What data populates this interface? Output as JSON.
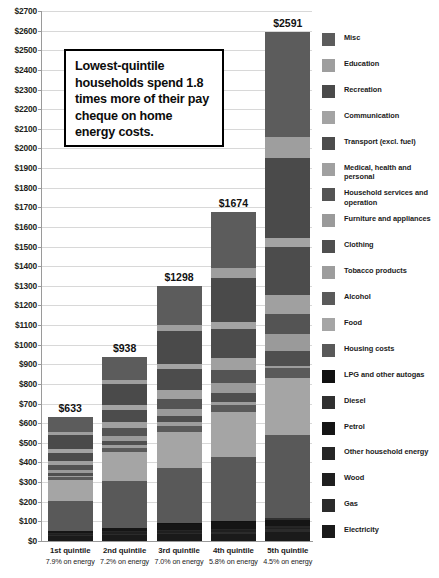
{
  "chart_data": {
    "type": "bar",
    "subtype": "stacked-bar",
    "title": "",
    "xlabel": "",
    "ylabel": "",
    "ylim": [
      0,
      2700
    ],
    "ytick_step": 100,
    "grid": true,
    "legend_position": "right",
    "currency_prefix": "$",
    "categories": [
      "1st quintile",
      "2nd quintile",
      "3rd quintile",
      "4th quintile",
      "5th quintile"
    ],
    "category_sublabels": [
      "7.9% on energy",
      "7.2% on energy",
      "7.0% on energy",
      "5.8% on energy",
      "4.5% on energy"
    ],
    "totals": [
      633,
      938,
      1298,
      1674,
      2591
    ],
    "total_labels": [
      "$633",
      "$938",
      "$1298",
      "$1674",
      "$2591"
    ],
    "ytick_labels": [
      "$2700",
      "$2600",
      "$2500",
      "$2400",
      "$2300",
      "$2200",
      "$2100",
      "$2000",
      "$1900",
      "$1800",
      "$1700",
      "$1600",
      "$1500",
      "$1400",
      "$1300",
      "$1200",
      "$1100",
      "$1000",
      "$900",
      "$800",
      "$700",
      "$600",
      "$500",
      "$400",
      "$300",
      "$200",
      "$100",
      "$0"
    ],
    "series": [
      {
        "name": "Electricity",
        "color": "#1a1a1a",
        "values": [
          26,
          30,
          33,
          37,
          45
        ]
      },
      {
        "name": "Gas",
        "color": "#2b2b2b",
        "values": [
          5,
          7,
          8,
          10,
          14
        ]
      },
      {
        "name": "Wood",
        "color": "#1f1f1f",
        "values": [
          6,
          8,
          9,
          9,
          9
        ]
      },
      {
        "name": "Other household energy",
        "color": "#262626",
        "values": [
          3,
          4,
          4,
          5,
          6
        ]
      },
      {
        "name": "Petrol",
        "color": "#151515",
        "values": [
          9,
          16,
          30,
          33,
          35
        ]
      },
      {
        "name": "Diesel",
        "color": "#303030",
        "values": [
          1,
          2,
          3,
          4,
          6
        ]
      },
      {
        "name": "LPG and other autogas",
        "color": "#111111",
        "values": [
          1,
          1,
          2,
          2,
          2
        ]
      },
      {
        "name": "Housing costs",
        "color": "#595959",
        "values": [
          154,
          239,
          282,
          327,
          421
        ]
      },
      {
        "name": "Food",
        "color": "#a5a5a5",
        "values": [
          105,
          146,
          186,
          231,
          293
        ]
      },
      {
        "name": "Alcohol",
        "color": "#5a5a5a",
        "values": [
          13,
          21,
          31,
          36,
          49
        ]
      },
      {
        "name": "Tobacco products",
        "color": "#9d9d9d",
        "values": [
          8,
          15,
          18,
          16,
          13
        ]
      },
      {
        "name": "Clothing",
        "color": "#4f4f4f",
        "values": [
          14,
          21,
          32,
          44,
          73
        ]
      },
      {
        "name": "Furniture and appliances",
        "color": "#9a9a9a",
        "values": [
          14,
          23,
          33,
          48,
          86
        ]
      },
      {
        "name": "Household services and operation",
        "color": "#545454",
        "values": [
          28,
          40,
          53,
          70,
          105
        ]
      },
      {
        "name": "Medical, health and personal",
        "color": "#a0a0a0",
        "values": [
          21,
          33,
          45,
          62,
          98
        ]
      },
      {
        "name": "Transport (excl. fuel)",
        "color": "#4c4c4c",
        "values": [
          41,
          63,
          105,
          147,
          245
        ]
      },
      {
        "name": "Communication",
        "color": "#a3a3a3",
        "values": [
          20,
          25,
          30,
          35,
          45
        ]
      },
      {
        "name": "Recreation",
        "color": "#4a4a4a",
        "values": [
          72,
          105,
          165,
          222,
          404
        ]
      },
      {
        "name": "Education",
        "color": "#9e9e9e",
        "values": [
          14,
          19,
          33,
          51,
          110
        ]
      },
      {
        "name": "Misc",
        "color": "#5c5c5c",
        "values": [
          78,
          120,
          196,
          285,
          532
        ]
      }
    ],
    "annotation": {
      "text": "Lowest-quintile households spend 1.8 times more of their pay cheque on home energy costs.",
      "border_color": "#000000",
      "background": "#ffffff"
    }
  },
  "legend": {
    "items": [
      {
        "label": "Misc",
        "color": "#5c5c5c"
      },
      {
        "label": "Education",
        "color": "#9e9e9e"
      },
      {
        "label": "Recreation",
        "color": "#4a4a4a"
      },
      {
        "label": "Communication",
        "color": "#a3a3a3"
      },
      {
        "label": "Transport (excl. fuel)",
        "color": "#4c4c4c"
      },
      {
        "label": "Medical, health and personal",
        "color": "#a0a0a0"
      },
      {
        "label": "Household services and\noperation",
        "color": "#545454"
      },
      {
        "label": "Furniture and appliances",
        "color": "#9a9a9a"
      },
      {
        "label": "Clothing",
        "color": "#4f4f4f"
      },
      {
        "label": "Tobacco products",
        "color": "#9d9d9d"
      },
      {
        "label": "Alcohol",
        "color": "#5a5a5a"
      },
      {
        "label": "Food",
        "color": "#a5a5a5"
      },
      {
        "label": "Housing costs",
        "color": "#595959"
      },
      {
        "label": "LPG and other autogas",
        "color": "#111111"
      },
      {
        "label": "Diesel",
        "color": "#303030"
      },
      {
        "label": "Petrol",
        "color": "#151515"
      },
      {
        "label": "Other household energy",
        "color": "#262626"
      },
      {
        "label": "Wood",
        "color": "#1f1f1f"
      },
      {
        "label": "Gas",
        "color": "#2b2b2b"
      },
      {
        "label": "Electricity",
        "color": "#1a1a1a"
      }
    ]
  }
}
